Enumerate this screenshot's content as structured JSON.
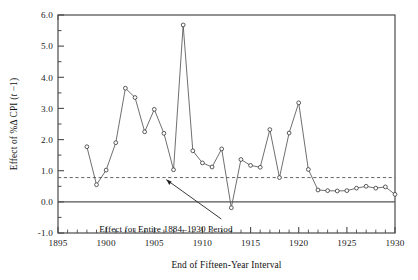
{
  "chart_data": {
    "type": "line",
    "title": "",
    "subtitle": "",
    "xlabel": "End of Fifteen-Year Interval",
    "ylabel": "Effect of %Δ CPI (t −1)",
    "xlim": [
      1895,
      1930
    ],
    "ylim": [
      -1.0,
      6.0
    ],
    "xticks": [
      1895,
      1900,
      1905,
      1910,
      1915,
      1920,
      1925,
      1930
    ],
    "xtick_labels": [
      "1895",
      "1900",
      "1905",
      "1910",
      "1915",
      "1920",
      "1925",
      "1930"
    ],
    "yticks": [
      -1.0,
      0.0,
      1.0,
      2.0,
      3.0,
      4.0,
      5.0,
      6.0
    ],
    "ytick_labels": [
      "-1.0",
      "0.0",
      "1.0",
      "2.0",
      "3.0",
      "4.0",
      "5.0",
      "6.0"
    ],
    "minor_xtick_step": 1,
    "minor_ytick_step": 0.5,
    "grid": false,
    "legend": null,
    "marker": "open-circle",
    "line_color": "#555555",
    "marker_color": "#333333",
    "x": [
      1898,
      1899,
      1900,
      1901,
      1902,
      1903,
      1904,
      1905,
      1906,
      1907,
      1908,
      1909,
      1910,
      1911,
      1912,
      1913,
      1914,
      1915,
      1916,
      1917,
      1918,
      1919,
      1920,
      1921,
      1922,
      1923,
      1924,
      1925,
      1926,
      1927,
      1928,
      1929,
      1930
    ],
    "values": [
      1.77,
      0.55,
      1.02,
      1.9,
      3.65,
      3.35,
      2.25,
      2.97,
      2.2,
      1.03,
      5.68,
      1.64,
      1.25,
      1.12,
      1.7,
      -0.19,
      1.36,
      1.17,
      1.11,
      2.32,
      0.78,
      2.21,
      3.18,
      1.04,
      0.38,
      0.36,
      0.35,
      0.36,
      0.44,
      0.5,
      0.44,
      0.48,
      0.24
    ],
    "reference_line": {
      "value": 0.78,
      "style": "dashed",
      "color": "#666666",
      "label": "Effect for Entire 1884–1930 Period"
    },
    "zero_line": {
      "value": 0.0,
      "style": "solid",
      "color": "#555555"
    },
    "annotation": {
      "text": "Effect for Entire 1884–1930 Period",
      "arrow_from_x": 1912.0,
      "arrow_from_y": -0.55,
      "arrow_to_x": 1906.3,
      "arrow_to_y": 0.72
    }
  },
  "axes": {
    "ylabel_parts": {
      "prefix": "Effect of %Δ CPI (",
      "italic_t": "t",
      "middle": " −1",
      "suffix": ")"
    }
  }
}
